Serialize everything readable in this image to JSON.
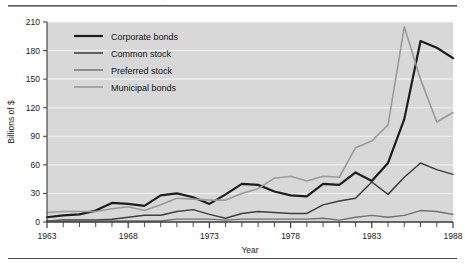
{
  "figure": {
    "caption": "EXHIBIT 4-1  U.S. Public Securities Issues, 1963-1988",
    "axis_frame_color": "#3a3a3a",
    "plot_background": "#d8d8d8",
    "gridline_color": "#f2f2f2",
    "page_background": "#ffffff"
  },
  "legend": {
    "position": "top-left-inside",
    "entries": [
      {
        "label": "Corporate bonds",
        "color": "#1c1c1c",
        "width": 2.2
      },
      {
        "label": "Common stock",
        "color": "#3d3d3d",
        "width": 1.5
      },
      {
        "label": "Preferred stock",
        "color": "#6f6f6f",
        "width": 1.4
      },
      {
        "label": "Municipal bonds",
        "color": "#9a9a9a",
        "width": 1.6
      }
    ]
  },
  "axes": {
    "y": {
      "label": "Billions of $",
      "ticks": [
        0,
        30,
        60,
        90,
        120,
        150,
        180,
        210
      ],
      "min": 0,
      "max": 210
    },
    "x": {
      "label": "Year",
      "ticks": [
        1963,
        1968,
        1973,
        1978,
        1983,
        1988
      ],
      "minor_tick_interval": 1,
      "min": 1963,
      "max": 1988
    }
  },
  "chart_data": {
    "type": "line",
    "title": "EXHIBIT 4-1  U.S. Public Securities Issues, 1963-1988",
    "xlabel": "Year",
    "ylabel": "Billions of $",
    "xlim": [
      1963,
      1988
    ],
    "ylim": [
      0,
      210
    ],
    "grid": true,
    "legend_position": "upper left",
    "x": [
      1963,
      1964,
      1965,
      1966,
      1967,
      1968,
      1969,
      1970,
      1971,
      1972,
      1973,
      1974,
      1975,
      1976,
      1977,
      1978,
      1979,
      1980,
      1981,
      1982,
      1983,
      1984,
      1985,
      1986,
      1987,
      1988
    ],
    "categories": [
      "1963",
      "1964",
      "1965",
      "1966",
      "1967",
      "1968",
      "1969",
      "1970",
      "1971",
      "1972",
      "1973",
      "1974",
      "1975",
      "1976",
      "1977",
      "1978",
      "1979",
      "1980",
      "1981",
      "1982",
      "1983",
      "1984",
      "1985",
      "1986",
      "1987",
      "1988"
    ],
    "series": [
      {
        "name": "Corporate bonds",
        "color": "#1c1c1c",
        "values": [
          5,
          7,
          8,
          12,
          20,
          19,
          17,
          28,
          30,
          26,
          19,
          29,
          40,
          39,
          32,
          28,
          27,
          40,
          39,
          52,
          43,
          62,
          108,
          190,
          183,
          172
        ]
      },
      {
        "name": "Common stock",
        "color": "#3d3d3d",
        "values": [
          1,
          2,
          2,
          2,
          3,
          5,
          7,
          7,
          11,
          13,
          8,
          4,
          9,
          11,
          10,
          9,
          9,
          18,
          22,
          25,
          42,
          29,
          47,
          62,
          55,
          50
        ]
      },
      {
        "name": "Preferred stock",
        "color": "#6f6f6f",
        "values": [
          1,
          1,
          1,
          1,
          1,
          1,
          1,
          1,
          3,
          3,
          3,
          2,
          3,
          3,
          3,
          3,
          3,
          4,
          2,
          5,
          7,
          5,
          7,
          12,
          11,
          8
        ]
      },
      {
        "name": "Municipal bonds",
        "color": "#9a9a9a",
        "values": [
          10,
          11,
          11,
          11,
          14,
          16,
          12,
          18,
          25,
          24,
          23,
          23,
          30,
          35,
          46,
          48,
          43,
          48,
          47,
          78,
          85,
          102,
          205,
          150,
          105,
          115
        ]
      }
    ]
  }
}
